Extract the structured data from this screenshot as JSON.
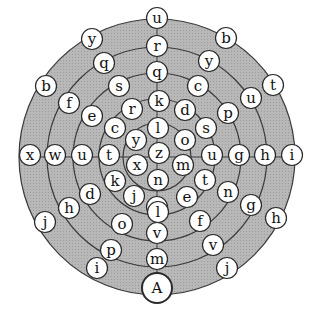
{
  "diagram": {
    "center": [
      157,
      157
    ],
    "ring_radii": [
      138,
      110,
      84,
      58,
      34
    ],
    "colors": {
      "ring_fill": "#b4b4b4",
      "ring_stroke": "#3a3a3a",
      "node_fill": "#ffffff",
      "node_stroke": "#2a2a2a",
      "text": "#111111",
      "background": "#ffffff"
    },
    "start_node": {
      "label": "A",
      "x": 157,
      "y": 288
    },
    "nodes": [
      {
        "label": "u",
        "x": 157,
        "y": 18
      },
      {
        "label": "r",
        "x": 157,
        "y": 46
      },
      {
        "label": "q",
        "x": 157,
        "y": 72
      },
      {
        "label": "k",
        "x": 159,
        "y": 101
      },
      {
        "label": "l",
        "x": 158,
        "y": 128
      },
      {
        "label": "z",
        "x": 159,
        "y": 153
      },
      {
        "label": "n",
        "x": 158,
        "y": 180
      },
      {
        "label": "j",
        "x": 157,
        "y": 207
      },
      {
        "label": "l",
        "x": 158,
        "y": 212
      },
      {
        "label": "v",
        "x": 157,
        "y": 233
      },
      {
        "label": "m",
        "x": 157,
        "y": 259
      },
      {
        "label": "y",
        "x": 92,
        "y": 39
      },
      {
        "label": "q",
        "x": 104,
        "y": 63
      },
      {
        "label": "s",
        "x": 119,
        "y": 86
      },
      {
        "label": "b",
        "x": 46,
        "y": 86
      },
      {
        "label": "f",
        "x": 69,
        "y": 103
      },
      {
        "label": "e",
        "x": 92,
        "y": 116
      },
      {
        "label": "r",
        "x": 132,
        "y": 109
      },
      {
        "label": "c",
        "x": 115,
        "y": 128
      },
      {
        "label": "y",
        "x": 136,
        "y": 140
      },
      {
        "label": "x",
        "x": 30,
        "y": 155
      },
      {
        "label": "w",
        "x": 55,
        "y": 155
      },
      {
        "label": "u",
        "x": 82,
        "y": 155
      },
      {
        "label": "t",
        "x": 109,
        "y": 155
      },
      {
        "label": "x",
        "x": 137,
        "y": 165
      },
      {
        "label": "k",
        "x": 115,
        "y": 181
      },
      {
        "label": "j",
        "x": 134,
        "y": 196
      },
      {
        "label": "d",
        "x": 90,
        "y": 194
      },
      {
        "label": "h",
        "x": 69,
        "y": 208
      },
      {
        "label": "j",
        "x": 45,
        "y": 222
      },
      {
        "label": "o",
        "x": 122,
        "y": 224
      },
      {
        "label": "p",
        "x": 111,
        "y": 250
      },
      {
        "label": "i",
        "x": 97,
        "y": 268
      },
      {
        "label": "b",
        "x": 226,
        "y": 38
      },
      {
        "label": "y",
        "x": 209,
        "y": 61
      },
      {
        "label": "c",
        "x": 198,
        "y": 86
      },
      {
        "label": "t",
        "x": 273,
        "y": 85
      },
      {
        "label": "u",
        "x": 251,
        "y": 98
      },
      {
        "label": "d",
        "x": 185,
        "y": 110
      },
      {
        "label": "p",
        "x": 228,
        "y": 113
      },
      {
        "label": "s",
        "x": 206,
        "y": 128
      },
      {
        "label": "o",
        "x": 185,
        "y": 140
      },
      {
        "label": "u",
        "x": 212,
        "y": 155
      },
      {
        "label": "g",
        "x": 239,
        "y": 155
      },
      {
        "label": "h",
        "x": 265,
        "y": 155
      },
      {
        "label": "i",
        "x": 292,
        "y": 155
      },
      {
        "label": "m",
        "x": 183,
        "y": 165
      },
      {
        "label": "t",
        "x": 205,
        "y": 180
      },
      {
        "label": "e",
        "x": 187,
        "y": 197
      },
      {
        "label": "n",
        "x": 228,
        "y": 192
      },
      {
        "label": "g",
        "x": 251,
        "y": 205
      },
      {
        "label": "h",
        "x": 276,
        "y": 218
      },
      {
        "label": "f",
        "x": 200,
        "y": 221
      },
      {
        "label": "v",
        "x": 213,
        "y": 245
      },
      {
        "label": "j",
        "x": 227,
        "y": 268
      }
    ]
  }
}
